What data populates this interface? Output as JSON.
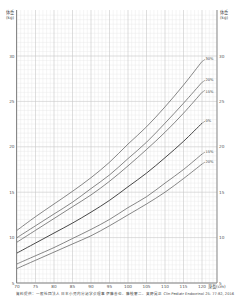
{
  "chart_data": {
    "type": "line",
    "title": "",
    "ylabel": "体重 (kg)",
    "ylabel_line1": "体重",
    "ylabel_line2": "(kg)",
    "xlabel": "身長(cm)",
    "xlim": [
      70,
      124
    ],
    "ylim": [
      5,
      34.5
    ],
    "x_ticks": [
      70,
      75,
      80,
      85,
      90,
      95,
      100,
      105,
      110,
      115,
      120
    ],
    "y_ticks": [
      5,
      10,
      15,
      20,
      25,
      30
    ],
    "grid": true,
    "legend_position": "inline-right",
    "x": [
      70,
      75,
      80,
      85,
      90,
      95,
      100,
      105,
      110,
      115,
      120
    ],
    "series": [
      {
        "name": "30%",
        "values": [
          10.8,
          12.3,
          13.7,
          15.1,
          16.6,
          18.3,
          20.3,
          22.2,
          24.4,
          26.8,
          29.4
        ]
      },
      {
        "name": "20%",
        "values": [
          10.0,
          11.3,
          12.6,
          13.9,
          15.4,
          16.9,
          18.7,
          20.5,
          22.6,
          24.8,
          27.1
        ]
      },
      {
        "name": "15%",
        "values": [
          9.5,
          10.8,
          12.1,
          13.4,
          14.7,
          16.2,
          17.9,
          19.7,
          21.6,
          23.7,
          26.0
        ]
      },
      {
        "name": "0%",
        "values": [
          8.3,
          9.4,
          10.5,
          11.6,
          12.8,
          14.1,
          15.6,
          17.1,
          18.8,
          20.6,
          22.6
        ]
      },
      {
        "name": "-15%",
        "values": [
          7.1,
          8.0,
          8.9,
          9.9,
          10.9,
          12.0,
          13.3,
          14.5,
          16.0,
          17.5,
          19.2
        ]
      },
      {
        "name": "-20%",
        "values": [
          6.6,
          7.5,
          8.4,
          9.3,
          10.2,
          11.3,
          12.5,
          13.7,
          15.0,
          16.5,
          18.1
        ]
      }
    ],
    "series_labels": [
      "30%",
      "20%",
      "15%",
      "0%",
      "15%",
      "20%"
    ]
  },
  "footer": {
    "source": "資料提供：一般社団法人 日本小児内分泌学会理事 伊藤善也、藤枝憲二、奥野晃正 Clin Pediatr Endocrinol 25: 77-82, 2016"
  },
  "colors": {
    "axis": "#888888",
    "grid_major": "#c8c8c8",
    "grid_minor": "#e6e6e6",
    "curve": "#555555",
    "curve_center": "#333333"
  }
}
